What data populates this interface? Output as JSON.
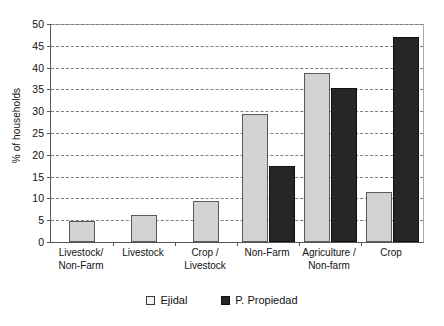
{
  "chart_data": {
    "type": "bar",
    "title": "",
    "xlabel": "",
    "ylabel": "% of households",
    "ylim": [
      0,
      50
    ],
    "yticks": [
      0,
      5,
      10,
      15,
      20,
      25,
      30,
      35,
      40,
      45,
      50
    ],
    "grid": "horizontal-dashed",
    "legend_position": "bottom-center",
    "categories": [
      "Livestock/\nNon-Farm",
      "Livestock",
      "Crop /\nLivestock",
      "Non-Farm",
      "Agriculture /\nNon-farm",
      "Crop"
    ],
    "category_lines": [
      [
        "Livestock/",
        "Non-Farm"
      ],
      [
        "Livestock",
        ""
      ],
      [
        "Crop /",
        "Livestock"
      ],
      [
        "Non-Farm",
        ""
      ],
      [
        "Agriculture /",
        "Non-farm"
      ],
      [
        "Crop",
        ""
      ]
    ],
    "series": [
      {
        "name": "Ejidal",
        "color": "#d2d2d2",
        "values": [
          4.8,
          6.2,
          9.5,
          29.3,
          38.7,
          11.5
        ]
      },
      {
        "name": "P. Propiedad",
        "color": "#262626",
        "values": [
          0,
          0,
          0,
          17.4,
          35.3,
          47.0
        ]
      }
    ]
  },
  "legend": {
    "items": [
      {
        "label": "Ejidal",
        "swatch": "light"
      },
      {
        "label": "P. Propiedad",
        "swatch": "dark"
      }
    ]
  }
}
